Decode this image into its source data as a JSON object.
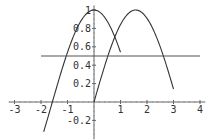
{
  "chart_data": {
    "type": "line",
    "title": "",
    "xlabel": "",
    "ylabel": "",
    "xlim": [
      -3.2,
      4.2
    ],
    "ylim": [
      -0.4,
      1.05
    ],
    "grid": false,
    "legend": null,
    "x_ticks": [
      -3,
      -2,
      -1,
      1,
      2,
      3,
      4
    ],
    "x_tick_labels": [
      "-3",
      "-2",
      "-1",
      "1",
      "2",
      "3",
      "4"
    ],
    "y_ticks": [
      1,
      0.8,
      0.6,
      0.4,
      0.2,
      -0.2
    ],
    "y_tick_labels": [
      "1",
      "0.8",
      "0.6",
      "0.4",
      "0.2",
      "-0.2"
    ],
    "series": [
      {
        "name": "cos(x)",
        "function": "cos",
        "x_range": [
          -1.9,
          1.0
        ],
        "color": "#333333"
      },
      {
        "name": "sin(x)",
        "function": "sin",
        "x_range": [
          0.0,
          3.0
        ],
        "color": "#333333"
      },
      {
        "name": "y = 0.5",
        "function": "const",
        "value": 0.5,
        "x_range": [
          -2.0,
          4.0
        ],
        "color": "#555555"
      }
    ]
  },
  "plot": {
    "origin_px": [
      94,
      102
    ],
    "px_per_x": 26.5,
    "px_per_y": 92,
    "axis_color": "#666666",
    "curve_color": "#333333"
  }
}
